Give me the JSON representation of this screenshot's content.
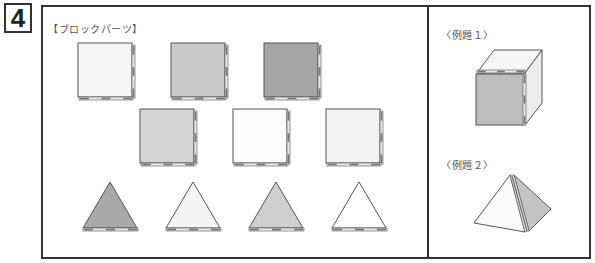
{
  "question_number": "4",
  "parts_section": {
    "label": "【ブロックパーツ】",
    "squares_row1": [
      {
        "fill": "#f6f6f6"
      },
      {
        "fill": "#c9c9c9"
      },
      {
        "fill": "#a5a5a5"
      }
    ],
    "squares_row2": [
      {
        "fill": "#d4d4d4"
      },
      {
        "fill": "#fbfbfb"
      },
      {
        "fill": "#f3f3f3"
      }
    ],
    "triangles": [
      {
        "fill": "#a9a9a9"
      },
      {
        "fill": "#f5f5f5"
      },
      {
        "fill": "#cfcfcf"
      },
      {
        "fill": "#ffffff"
      }
    ]
  },
  "example1": {
    "label": "〈例題１〉",
    "front_fill": "#bdbdbd",
    "top_fill": "#f7f7f7",
    "side_fill": "#ececec"
  },
  "example2": {
    "label": "〈例題２〉",
    "left_fill": "#fafafa",
    "right_fill": "#c4c4c4"
  },
  "colors": {
    "stroke": "#555555",
    "hinge_dark": "#777777",
    "hinge_light": "#e8e8e8",
    "border": "#333333"
  }
}
